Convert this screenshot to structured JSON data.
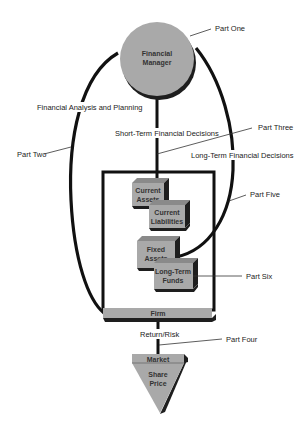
{
  "diagram": {
    "nodes": {
      "financial_manager": {
        "line1": "Financial",
        "line2": "Manager"
      },
      "current_assets": {
        "line1": "Current",
        "line2": "Assets"
      },
      "current_liabilities": {
        "line1": "Current",
        "line2": "Liabilities"
      },
      "fixed_assets": {
        "line1": "Fixed",
        "line2": "Assets"
      },
      "long_term_funds": {
        "line1": "Long-Term",
        "line2": "Funds"
      },
      "firm": {
        "label": "Firm"
      },
      "market": {
        "label": "Market"
      },
      "share_price": {
        "line1": "Share",
        "line2": "Price"
      }
    },
    "flows": {
      "financial_analysis": "Financial Analysis and Planning",
      "short_term": "Short-Term Financial Decisions",
      "long_term": "Long-Term Financial Decisions",
      "return_risk": "Return/Risk"
    },
    "callouts": {
      "part_one": "Part One",
      "part_two": "Part Two",
      "part_three": "Part Three",
      "part_four": "Part Four",
      "part_five": "Part Five",
      "part_six": "Part Six"
    },
    "colors": {
      "fill_gray": "#a9a9a9",
      "shadow": "#1e1e1e",
      "line": "#111111"
    }
  }
}
